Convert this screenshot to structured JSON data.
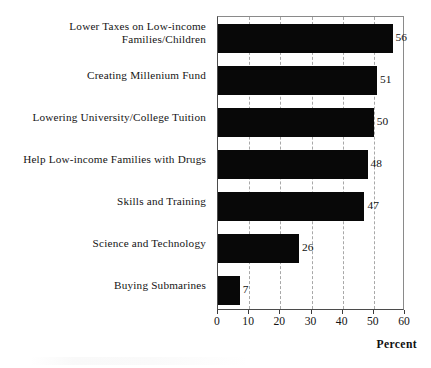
{
  "chart_data": {
    "type": "bar",
    "orientation": "horizontal",
    "title": "",
    "xlabel": "Percent",
    "ylabel": "",
    "xlim": [
      0,
      60
    ],
    "xticks": [
      0,
      10,
      20,
      30,
      40,
      50,
      60
    ],
    "xtick_labels": [
      "0",
      "10",
      "20",
      "30",
      "40",
      "50",
      "60"
    ],
    "grid": "vertical-dashed",
    "legend": "none",
    "bar_color": "#080808",
    "categories": [
      "Lower Taxes on Low-income\nFamilies/Children",
      "Creating Millenium Fund",
      "Lowering University/College Tuition",
      "Help Low-income Families with Drugs",
      "Skills and Training",
      "Science and Technology",
      "Buying Submarines"
    ],
    "values": [
      56,
      51,
      50,
      48,
      47,
      26,
      7
    ],
    "value_labels": [
      "56",
      "51",
      "50",
      "48",
      "47",
      "26",
      "7"
    ]
  },
  "axis": {
    "percent_label": "Percent"
  }
}
